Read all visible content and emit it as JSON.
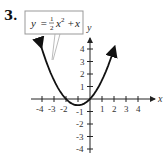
{
  "problem": {
    "number": "3."
  },
  "equation_label": {
    "lhs": "y",
    "equals": "=",
    "frac_num": "1",
    "frac_den": "2",
    "term1_var": "x",
    "term1_exp": "2",
    "plus": "+",
    "term2": "x"
  },
  "axes": {
    "x_label": "x",
    "y_label": "y",
    "x_ticks": [
      "-4",
      "-3",
      "-2",
      "1",
      "2",
      "3",
      "4"
    ],
    "y_ticks": [
      "4",
      "3",
      "2",
      "1",
      "-1",
      "-2",
      "-3",
      "-4"
    ]
  },
  "colors": {
    "curve": "#111111",
    "axis": "#222222",
    "box_border": "#999999"
  },
  "chart_data": {
    "type": "line",
    "xlabel": "x",
    "ylabel": "y",
    "xlim": [
      -4.5,
      5
    ],
    "ylim": [
      -4.5,
      4.8
    ],
    "grid": false,
    "x_ticks": [
      -4,
      -3,
      -2,
      -1,
      1,
      2,
      3,
      4
    ],
    "y_ticks": [
      -4,
      -3,
      -2,
      -1,
      1,
      2,
      3,
      4
    ],
    "series": [
      {
        "name": "y = 1/2 x^2 + x",
        "x": [
          -4,
          -3.5,
          -3,
          -2.5,
          -2,
          -1.5,
          -1,
          -0.5,
          0,
          0.5,
          1,
          1.5,
          2
        ],
        "y": [
          4,
          2.625,
          1.5,
          0.625,
          0,
          -0.375,
          -0.5,
          -0.375,
          0,
          0.625,
          1.5,
          2.625,
          4
        ]
      }
    ],
    "annotations": [
      "vertex at (-1, -0.5)",
      "x-intercepts at x = -2 and x = 0",
      "arrows at both ends of curve"
    ]
  }
}
